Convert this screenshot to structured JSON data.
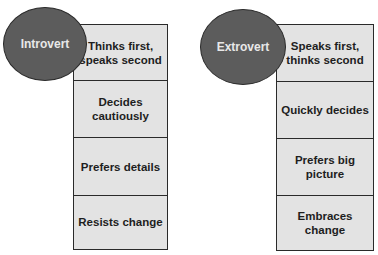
{
  "diagram": {
    "introvert": {
      "label": "Introvert",
      "traits": [
        "Thinks first, speaks second",
        "Decides cautiously",
        "Prefers details",
        "Resists change"
      ]
    },
    "extrovert": {
      "label": "Extrovert",
      "traits": [
        "Speaks first, thinks second",
        "Quickly decides",
        "Prefers big picture",
        "Embraces change"
      ]
    },
    "colors": {
      "ellipse": "#5c5c5c",
      "box": "#e3e3e3",
      "border": "#2a2a2a",
      "ellipse_text": "#e8e8e8",
      "box_text": "#1e1e1e"
    }
  }
}
